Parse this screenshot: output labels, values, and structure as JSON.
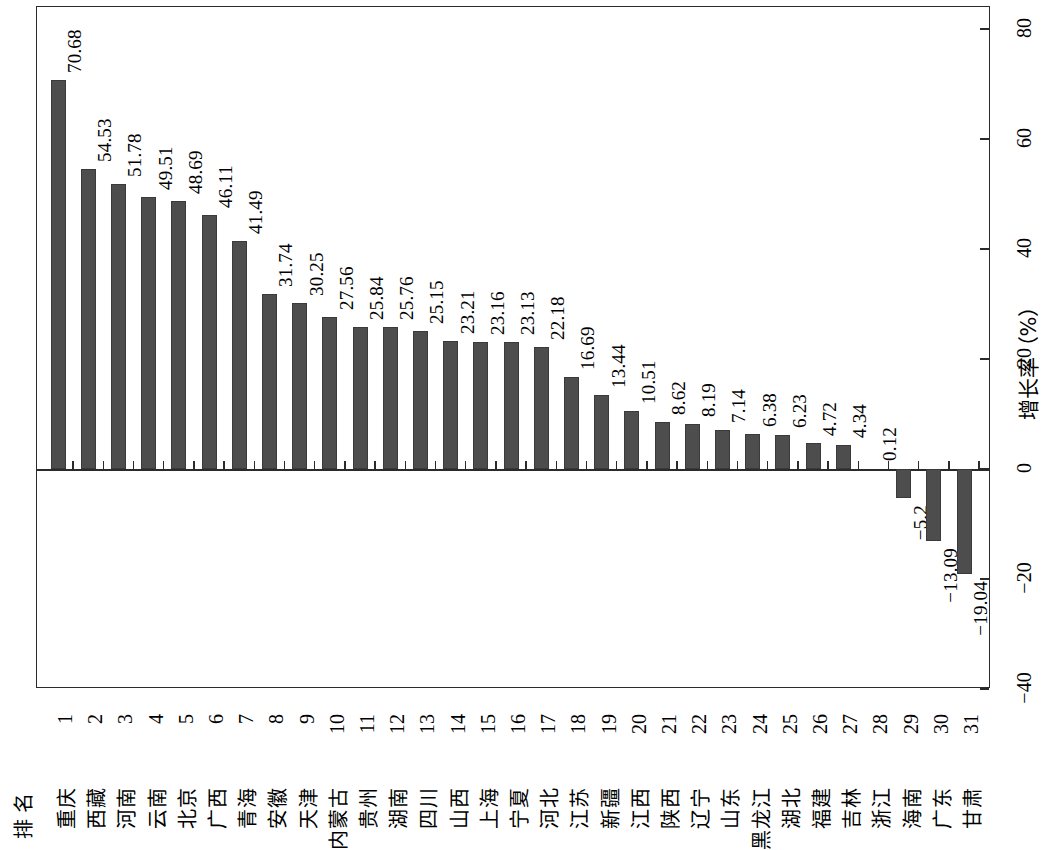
{
  "chart_data": {
    "type": "bar",
    "title": "",
    "xlabel": "排名",
    "ylabel": "增长率（%）",
    "ylim": [
      -40,
      80
    ],
    "yticks": [
      80,
      60,
      40,
      20,
      0,
      -20,
      -40
    ],
    "ytick_labels": [
      "80",
      "60",
      "40",
      "20",
      "0",
      "−20",
      "−40"
    ],
    "grid": false,
    "legend": null,
    "orientation": "vertical-bars-rotated-page",
    "bar_color": "#4d4d4d",
    "categories": [
      "重庆",
      "西藏",
      "河南",
      "云南",
      "北京",
      "广西",
      "青海",
      "安徽",
      "天津",
      "内蒙古",
      "贵州",
      "湖南",
      "四川",
      "山西",
      "上海",
      "宁夏",
      "河北",
      "江苏",
      "新疆",
      "江西",
      "陕西",
      "辽宁",
      "山东",
      "黑龙江",
      "湖北",
      "福建",
      "吉林",
      "浙江",
      "海南",
      "广东",
      "甘肃"
    ],
    "ranks": [
      "1",
      "2",
      "3",
      "4",
      "5",
      "6",
      "7",
      "8",
      "9",
      "10",
      "11",
      "12",
      "13",
      "14",
      "15",
      "16",
      "17",
      "18",
      "19",
      "20",
      "21",
      "22",
      "23",
      "24",
      "25",
      "26",
      "27",
      "28",
      "29",
      "30",
      "31"
    ],
    "values": [
      70.68,
      54.53,
      51.78,
      49.51,
      48.69,
      46.11,
      41.49,
      31.74,
      30.25,
      27.56,
      25.84,
      25.76,
      25.15,
      23.21,
      23.16,
      23.13,
      22.18,
      16.69,
      13.44,
      10.51,
      8.62,
      8.19,
      7.14,
      6.38,
      6.23,
      4.72,
      4.34,
      0.12,
      -5.2,
      -13.09,
      -19.04
    ],
    "value_labels": [
      "70.68",
      "54.53",
      "51.78",
      "49.51",
      "48.69",
      "46.11",
      "41.49",
      "31.74",
      "30.25",
      "27.56",
      "25.84",
      "25.76",
      "25.15",
      "23.21",
      "23.16",
      "23.13",
      "22.18",
      "16.69",
      "13.44",
      "10.51",
      "8.62",
      "8.19",
      "7.14",
      "6.38",
      "6.23",
      "4.72",
      "4.34",
      "0.12",
      "−5.2",
      "−13.09",
      "−19.04"
    ]
  },
  "axis": {
    "rank_header": "排名",
    "value_axis_title": "增长率（%）"
  }
}
